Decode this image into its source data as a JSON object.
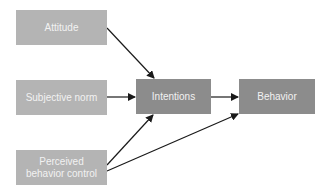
{
  "diagram": {
    "nodes": [
      {
        "id": "attitude",
        "label": "Attitude"
      },
      {
        "id": "subjective_norm",
        "label": "Subjective norm"
      },
      {
        "id": "perceived_control",
        "label": "Perceived behavior control"
      },
      {
        "id": "intentions",
        "label": "Intentions"
      },
      {
        "id": "behavior",
        "label": "Behavior"
      }
    ],
    "edges": [
      {
        "from": "attitude",
        "to": "intentions"
      },
      {
        "from": "subjective_norm",
        "to": "intentions"
      },
      {
        "from": "perceived_control",
        "to": "intentions"
      },
      {
        "from": "perceived_control",
        "to": "behavior"
      },
      {
        "from": "intentions",
        "to": "behavior"
      }
    ],
    "colors": {
      "input_box": "#b4b4b4",
      "central_box": "#8c8c8c",
      "text": "#f2f2f2",
      "arrow": "#1a1a1a"
    }
  },
  "labels": {
    "attitude": "Attitude",
    "subjective_norm": "Subjective norm",
    "perceived_line1": "Perceived",
    "perceived_line2": "behavior control",
    "intentions": "Intentions",
    "behavior": "Behavior"
  }
}
